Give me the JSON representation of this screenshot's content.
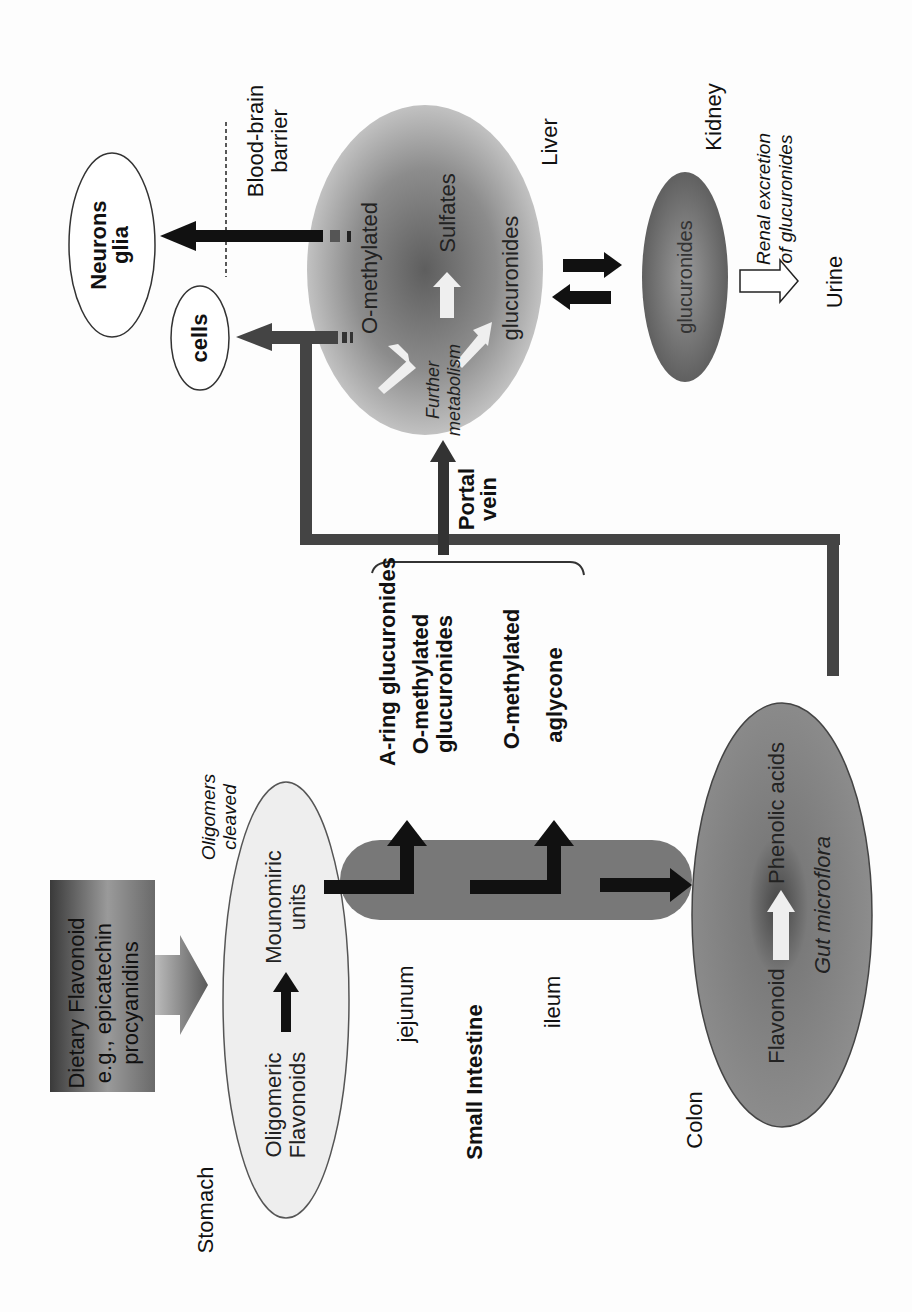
{
  "diagram": {
    "orientation": "rotated-90-ccw",
    "colors": {
      "background": "#fdfdfd",
      "liver_gradient_center": "#6e6e6e",
      "liver_gradient_edge": "#c8c8c8",
      "kidney_fill": "#777777",
      "colon_fill": "#8a8a8a",
      "stomach_fill": "#eeeeee",
      "intestine_fill": "#7a7a7a",
      "pathway_line": "#444444",
      "arrow_dark": "#111111"
    },
    "source_box": {
      "line1": "Dietary Flavonoid",
      "line2": "e.g., epicatechin",
      "line3": "procyanidins"
    },
    "stomach": {
      "label": "Stomach",
      "content_left": "Oligomeric",
      "content_left2": "Flavonoids",
      "content_right": "Mounomiric",
      "content_right2": "units",
      "note_line1": "Oligomers",
      "note_line2": "cleaved"
    },
    "small_intestine": {
      "label": "Small Intestine",
      "segment1": "jejunum",
      "segment2": "ileum"
    },
    "absorbed_metabolites": [
      "A-ring glucuronides",
      "O-methylated",
      "glucuronides",
      "O-methylated",
      "aglycone"
    ],
    "portal_vein": {
      "line1": "Portal",
      "line2": "vein"
    },
    "liver": {
      "label": "Liver",
      "metabolite1": "O-methylated",
      "metabolite2": "Sulfates",
      "metabolite3": "glucuronides",
      "process_line1": "Further",
      "process_line2": "metabolism"
    },
    "targets": {
      "cells": "cells",
      "neurons_line1": "Neurons",
      "neurons_line2": "glia",
      "bbb_line1": "Blood-brain",
      "bbb_line2": "barrier"
    },
    "kidney": {
      "label": "Kidney",
      "content": "glucuronides",
      "excretion_line1": "Renal excretion",
      "excretion_line2": "of glucuronides",
      "output": "Urine"
    },
    "colon": {
      "label": "Colon",
      "content_left": "Flavonoid",
      "content_right": "Phenolic acids",
      "agent": "Gut microflora"
    }
  }
}
